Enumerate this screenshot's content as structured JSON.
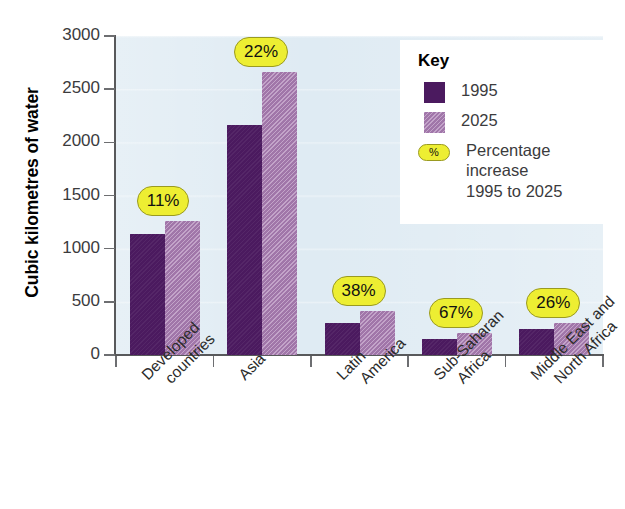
{
  "chart_data": {
    "type": "bar",
    "title": "",
    "xlabel": "",
    "ylabel": "Cubic kilometres of water",
    "ylim": [
      0,
      3000
    ],
    "ytick_values": [
      0,
      500,
      1000,
      1500,
      2000,
      2500,
      3000
    ],
    "ytick_labels": [
      "0",
      "500",
      "1000",
      "1500",
      "2000",
      "2500",
      "3000"
    ],
    "grid": true,
    "legend_position": "top-right",
    "categories": [
      "Developed countries",
      "Asia",
      "Latin America",
      "Sub-Saharan Africa",
      "Middle East and North Africa"
    ],
    "category_lines": [
      [
        "Developed",
        "countries"
      ],
      [
        "Asia",
        ""
      ],
      [
        "Latin",
        "America"
      ],
      [
        "Sub-Saharan",
        "Africa"
      ],
      [
        "Middle East and",
        "North Africa"
      ]
    ],
    "series": [
      {
        "name": "1995",
        "color": "#4b1a5f",
        "values": [
          1140,
          2160,
          305,
          150,
          240
        ]
      },
      {
        "name": "2025",
        "color": "#a97cb2",
        "values": [
          1260,
          2660,
          410,
          205,
          300
        ]
      }
    ],
    "annotations": [
      {
        "label": "11%",
        "category": "Developed countries"
      },
      {
        "label": "22%",
        "category": "Asia"
      },
      {
        "label": "38%",
        "category": "Latin America"
      },
      {
        "label": "67%",
        "category": "Sub-Saharan Africa"
      },
      {
        "label": "26%",
        "category": "Middle East and North Africa"
      }
    ]
  },
  "legend": {
    "title": "Key",
    "items": [
      {
        "label": "1995",
        "swatch": "#4b1a5f"
      },
      {
        "label": "2025",
        "swatch": "#a97cb2"
      }
    ],
    "percent_key": {
      "symbol": "%",
      "line1": "Percentage",
      "line2": "increase",
      "line3": "1995 to 2025"
    }
  },
  "colors": {
    "series_1995": "#4b1a5f",
    "series_2025": "#a97cb2",
    "plot_background": "#dfebf3",
    "badge_fill": "#edee32",
    "badge_border": "#9a9a20",
    "axis": "#58595b"
  }
}
